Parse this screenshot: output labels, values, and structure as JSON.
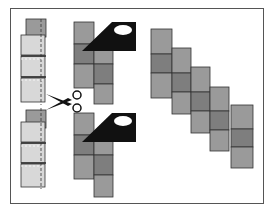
{
  "diagram": {
    "title": "",
    "colors": {
      "frame": "#555555",
      "light_square": "#d8d8d8",
      "mid_square": "#9a9a9a",
      "dark_square": "#7e7e7e",
      "outline": "#333333",
      "tool": "#111111"
    },
    "steps": [
      {
        "id": "strip-set",
        "label": "Stacked fabric strips with dashed cut lines"
      },
      {
        "id": "scissors",
        "label": "Scissors cutting"
      },
      {
        "id": "iron-top",
        "label": "Iron pressing upper segment"
      },
      {
        "id": "iron-bottom",
        "label": "Iron pressing lower segment"
      },
      {
        "id": "diagonal-layout",
        "label": "Segments arranged in staggered diagonal"
      }
    ],
    "diagonal_columns": 5
  }
}
